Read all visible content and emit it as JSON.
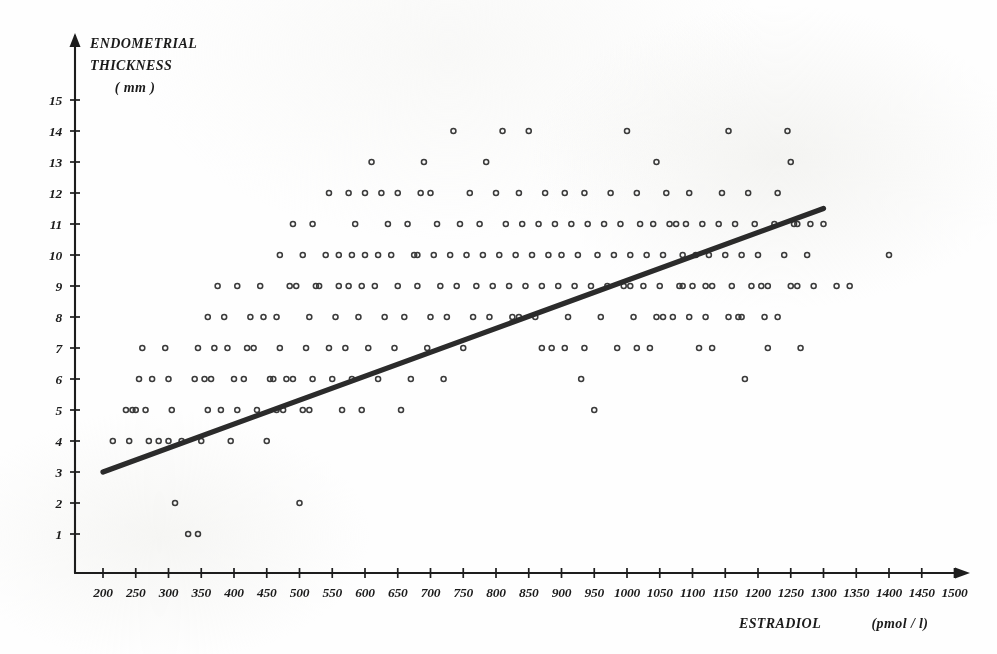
{
  "chart_data": {
    "type": "scatter",
    "title": "",
    "xlabel": "ESTRADIOL   (pmol / l)",
    "ylabel_lines": [
      "ENDOMETRIAL",
      "THICKNESS",
      "( mm )"
    ],
    "xlabel_main": "ESTRADIOL",
    "xlabel_unit": "(pmol / l)",
    "xlim": [
      150,
      1520
    ],
    "ylim": [
      0,
      15.6
    ],
    "xticks": [
      200,
      250,
      300,
      350,
      400,
      450,
      500,
      550,
      600,
      650,
      700,
      750,
      800,
      850,
      900,
      950,
      1000,
      1050,
      1100,
      1150,
      1200,
      1250,
      1300,
      1350,
      1400,
      1450,
      1500
    ],
    "xtick_labels": [
      "200",
      "250",
      "300",
      "350",
      "400",
      "450",
      "500",
      "550",
      "600",
      "650",
      "700",
      "750",
      "800",
      "850",
      "900",
      "950",
      "1000",
      "1050",
      "1100",
      "1150",
      "1200",
      "1250",
      "1300",
      "1350",
      "1400",
      "1450",
      "1500"
    ],
    "yticks": [
      1,
      2,
      3,
      4,
      5,
      6,
      7,
      8,
      9,
      10,
      11,
      12,
      13,
      14,
      15
    ],
    "ytick_labels": [
      "1",
      "2",
      "3",
      "4",
      "5",
      "6",
      "7",
      "8",
      "9",
      "10",
      "11",
      "12",
      "13",
      "14",
      "15"
    ],
    "grid": false,
    "legend": "none",
    "marker": "open-circle",
    "marker_color": "#3b3b3b",
    "line_color": "#2b2b2b",
    "axis_color": "#1d1d1d",
    "regression_line": {
      "label": "regression-line",
      "x_start": 200,
      "y_start": 3.0,
      "x_end": 1300,
      "y_end": 11.5,
      "slope_per_1000": 7.73,
      "intercept": 1.45
    },
    "points": [
      [
        215,
        4
      ],
      [
        240,
        4
      ],
      [
        245,
        5
      ],
      [
        255,
        6
      ],
      [
        260,
        7
      ],
      [
        235,
        5
      ],
      [
        270,
        4
      ],
      [
        295,
        7
      ],
      [
        300,
        6
      ],
      [
        300,
        4
      ],
      [
        305,
        5
      ],
      [
        310,
        2
      ],
      [
        330,
        1
      ],
      [
        345,
        1
      ],
      [
        350,
        4
      ],
      [
        355,
        6
      ],
      [
        360,
        5
      ],
      [
        370,
        7
      ],
      [
        385,
        8
      ],
      [
        400,
        6
      ],
      [
        405,
        5
      ],
      [
        420,
        7
      ],
      [
        425,
        8
      ],
      [
        440,
        9
      ],
      [
        450,
        4
      ],
      [
        455,
        6
      ],
      [
        465,
        5
      ],
      [
        470,
        7
      ],
      [
        480,
        6
      ],
      [
        495,
        9
      ],
      [
        500,
        2
      ],
      [
        505,
        5
      ],
      [
        510,
        7
      ],
      [
        515,
        8
      ],
      [
        520,
        6
      ],
      [
        530,
        9
      ],
      [
        545,
        7
      ],
      [
        550,
        6
      ],
      [
        555,
        8
      ],
      [
        560,
        10
      ],
      [
        565,
        5
      ],
      [
        570,
        7
      ],
      [
        575,
        9
      ],
      [
        580,
        6
      ],
      [
        585,
        11
      ],
      [
        590,
        8
      ],
      [
        595,
        5
      ],
      [
        600,
        10
      ],
      [
        605,
        7
      ],
      [
        610,
        13
      ],
      [
        615,
        9
      ],
      [
        620,
        6
      ],
      [
        625,
        12
      ],
      [
        630,
        8
      ],
      [
        635,
        11
      ],
      [
        640,
        10
      ],
      [
        645,
        7
      ],
      [
        650,
        9
      ],
      [
        655,
        5
      ],
      [
        660,
        8
      ],
      [
        665,
        11
      ],
      [
        670,
        6
      ],
      [
        675,
        10
      ],
      [
        680,
        9
      ],
      [
        685,
        12
      ],
      [
        690,
        13
      ],
      [
        695,
        7
      ],
      [
        700,
        8
      ],
      [
        705,
        10
      ],
      [
        710,
        11
      ],
      [
        715,
        9
      ],
      [
        720,
        6
      ],
      [
        725,
        8
      ],
      [
        730,
        10
      ],
      [
        735,
        14
      ],
      [
        740,
        9
      ],
      [
        745,
        11
      ],
      [
        750,
        7
      ],
      [
        755,
        10
      ],
      [
        760,
        12
      ],
      [
        765,
        8
      ],
      [
        770,
        9
      ],
      [
        775,
        11
      ],
      [
        780,
        10
      ],
      [
        785,
        13
      ],
      [
        790,
        8
      ],
      [
        795,
        9
      ],
      [
        800,
        12
      ],
      [
        805,
        10
      ],
      [
        810,
        14
      ],
      [
        815,
        11
      ],
      [
        820,
        9
      ],
      [
        825,
        8
      ],
      [
        830,
        10
      ],
      [
        835,
        12
      ],
      [
        840,
        11
      ],
      [
        845,
        9
      ],
      [
        850,
        14
      ],
      [
        855,
        10
      ],
      [
        860,
        8
      ],
      [
        865,
        11
      ],
      [
        870,
        9
      ],
      [
        875,
        12
      ],
      [
        880,
        10
      ],
      [
        885,
        7
      ],
      [
        890,
        11
      ],
      [
        895,
        9
      ],
      [
        900,
        10
      ],
      [
        905,
        12
      ],
      [
        910,
        8
      ],
      [
        915,
        11
      ],
      [
        920,
        9
      ],
      [
        925,
        10
      ],
      [
        930,
        6
      ],
      [
        935,
        12
      ],
      [
        940,
        11
      ],
      [
        945,
        9
      ],
      [
        950,
        5
      ],
      [
        955,
        10
      ],
      [
        960,
        8
      ],
      [
        965,
        11
      ],
      [
        970,
        9
      ],
      [
        975,
        12
      ],
      [
        980,
        10
      ],
      [
        985,
        7
      ],
      [
        990,
        11
      ],
      [
        995,
        9
      ],
      [
        1000,
        14
      ],
      [
        1005,
        10
      ],
      [
        1010,
        8
      ],
      [
        1015,
        12
      ],
      [
        1020,
        11
      ],
      [
        1025,
        9
      ],
      [
        1030,
        10
      ],
      [
        1035,
        7
      ],
      [
        1040,
        11
      ],
      [
        1045,
        13
      ],
      [
        1050,
        9
      ],
      [
        1055,
        10
      ],
      [
        1060,
        12
      ],
      [
        1065,
        11
      ],
      [
        1070,
        8
      ],
      [
        1075,
        11
      ],
      [
        1080,
        9
      ],
      [
        1085,
        10
      ],
      [
        1090,
        11
      ],
      [
        1095,
        12
      ],
      [
        1100,
        9
      ],
      [
        1105,
        10
      ],
      [
        1110,
        7
      ],
      [
        1115,
        11
      ],
      [
        1120,
        8
      ],
      [
        1125,
        10
      ],
      [
        1130,
        9
      ],
      [
        1140,
        11
      ],
      [
        1145,
        12
      ],
      [
        1150,
        10
      ],
      [
        1155,
        14
      ],
      [
        1160,
        9
      ],
      [
        1165,
        11
      ],
      [
        1170,
        8
      ],
      [
        1175,
        10
      ],
      [
        1180,
        6
      ],
      [
        1185,
        12
      ],
      [
        1190,
        9
      ],
      [
        1195,
        11
      ],
      [
        1200,
        10
      ],
      [
        1210,
        8
      ],
      [
        1215,
        9
      ],
      [
        1225,
        11
      ],
      [
        1230,
        12
      ],
      [
        1240,
        10
      ],
      [
        1245,
        14
      ],
      [
        1250,
        13
      ],
      [
        1255,
        11
      ],
      [
        1260,
        9
      ],
      [
        1265,
        7
      ],
      [
        1275,
        10
      ],
      [
        1285,
        9
      ],
      [
        1300,
        11
      ],
      [
        1320,
        9
      ],
      [
        1340,
        9
      ],
      [
        1400,
        10
      ],
      [
        470,
        10
      ],
      [
        490,
        11
      ],
      [
        520,
        11
      ],
      [
        545,
        12
      ],
      [
        575,
        12
      ],
      [
        600,
        12
      ],
      [
        620,
        10
      ],
      [
        650,
        12
      ],
      [
        680,
        10
      ],
      [
        700,
        12
      ],
      [
        430,
        7
      ],
      [
        445,
        8
      ],
      [
        465,
        8
      ],
      [
        485,
        9
      ],
      [
        505,
        10
      ],
      [
        525,
        9
      ],
      [
        540,
        10
      ],
      [
        560,
        9
      ],
      [
        580,
        10
      ],
      [
        595,
        9
      ],
      [
        360,
        8
      ],
      [
        375,
        9
      ],
      [
        390,
        7
      ],
      [
        405,
        9
      ],
      [
        415,
        6
      ],
      [
        435,
        5
      ],
      [
        460,
        6
      ],
      [
        475,
        5
      ],
      [
        490,
        6
      ],
      [
        515,
        5
      ],
      [
        250,
        5
      ],
      [
        265,
        5
      ],
      [
        275,
        6
      ],
      [
        285,
        4
      ],
      [
        320,
        4
      ],
      [
        340,
        6
      ],
      [
        345,
        7
      ],
      [
        365,
        6
      ],
      [
        380,
        5
      ],
      [
        395,
        4
      ],
      [
        835,
        8
      ],
      [
        870,
        7
      ],
      [
        905,
        7
      ],
      [
        935,
        7
      ],
      [
        1015,
        7
      ],
      [
        1055,
        8
      ],
      [
        1095,
        8
      ],
      [
        1130,
        7
      ],
      [
        1175,
        8
      ],
      [
        1215,
        7
      ],
      [
        1250,
        9
      ],
      [
        1260,
        11
      ],
      [
        1280,
        11
      ],
      [
        1230,
        8
      ],
      [
        1205,
        9
      ],
      [
        1155,
        8
      ],
      [
        1120,
        9
      ],
      [
        1085,
        9
      ],
      [
        1045,
        8
      ],
      [
        1005,
        9
      ]
    ]
  }
}
